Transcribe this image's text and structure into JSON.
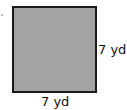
{
  "figure": {
    "shape": "square",
    "fill_color": "#a3a3a3",
    "border_color": "#1a1a1a",
    "side_label_right": "7 yd",
    "side_label_bottom": "7 yd"
  }
}
